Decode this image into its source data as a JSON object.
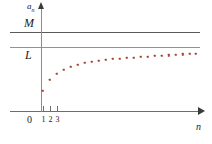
{
  "figure": {
    "name": "sequence-convergence-diagram",
    "colors": {
      "dots": "#a8432f",
      "line_M": "#5a5a5a",
      "line_L": "#7a93c8",
      "axis": "#6d6d6d",
      "background": "#ffffff"
    }
  },
  "labels": {
    "y_axis": "a",
    "y_axis_sub": "n",
    "x_axis": "n",
    "origin": "0",
    "upper_bound": "M",
    "limit": "L"
  },
  "x_ticks": [
    {
      "label": "1",
      "x": 43
    },
    {
      "label": "2",
      "x": 50
    },
    {
      "label": "3",
      "x": 57
    }
  ],
  "chart_data": {
    "type": "scatter",
    "title": "",
    "xlabel": "n",
    "ylabel": "a_n",
    "xlim": [
      0,
      24
    ],
    "ylim": [
      0,
      1.25
    ],
    "grid": false,
    "legend": null,
    "annotations": [
      {
        "text": "M",
        "type": "horizontal-line",
        "value": 1.08,
        "color": "#5a5a5a",
        "note": "upper bound"
      },
      {
        "text": "L",
        "type": "horizontal-line",
        "value": 0.94,
        "color": "#7a93c8",
        "note": "limit of the sequence"
      }
    ],
    "series": [
      {
        "name": "a_n",
        "color": "#a8432f",
        "marker": "square",
        "x": [
          1,
          2,
          3,
          4,
          5,
          6,
          7,
          8,
          9,
          10,
          11,
          12,
          13,
          14,
          15,
          16,
          17,
          18,
          19,
          20,
          21,
          22,
          23
        ],
        "y": [
          0.26,
          0.46,
          0.58,
          0.66,
          0.715,
          0.755,
          0.785,
          0.808,
          0.826,
          0.841,
          0.853,
          0.864,
          0.873,
          0.88,
          0.887,
          0.893,
          0.898,
          0.903,
          0.907,
          0.911,
          0.914,
          0.917,
          0.92
        ],
        "points_px": [
          [
            43,
            91
          ],
          [
            50,
            80
          ],
          [
            57,
            74
          ],
          [
            64,
            70
          ],
          [
            71,
            67
          ],
          [
            78,
            65
          ],
          [
            85,
            63
          ],
          [
            92,
            62
          ],
          [
            99,
            61
          ],
          [
            106,
            60
          ],
          [
            113,
            59
          ],
          [
            120,
            58.5
          ],
          [
            127,
            58
          ],
          [
            134,
            57.5
          ],
          [
            141,
            57
          ],
          [
            148,
            56.5
          ],
          [
            155,
            56
          ],
          [
            162,
            55.6
          ],
          [
            169,
            55.2
          ],
          [
            176,
            54.8
          ],
          [
            183,
            54.4
          ],
          [
            190,
            54.1
          ],
          [
            196,
            53.8
          ]
        ]
      }
    ]
  }
}
